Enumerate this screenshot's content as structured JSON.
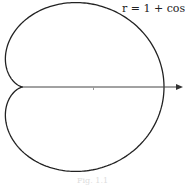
{
  "diagram": {
    "type": "polar-curve",
    "equation_label": "r = 1 + cosθ",
    "curve": "cardioid",
    "origin_px": [
      23,
      87
    ],
    "scale_x_px_per_unit": 70.5,
    "scale_y_px_per_unit": 65,
    "axis": {
      "from_x": 23,
      "to_x": 183,
      "arrow": true,
      "tick_at_unit": 1
    },
    "stroke_color": "#222222",
    "caption": "Fig. 1.1"
  }
}
